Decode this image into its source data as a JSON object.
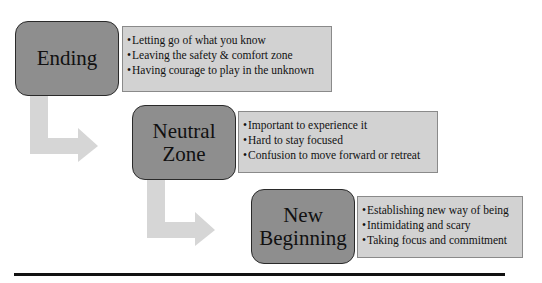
{
  "diagram": {
    "title": "",
    "phases": [
      {
        "label": "Ending",
        "bullets": [
          "Letting go of what you know",
          "Leaving the safety & comfort zone",
          "Having courage to play in the unknown"
        ]
      },
      {
        "label": "Neutral\nZone",
        "bullets": [
          "Important to experience it",
          "Hard to stay focused",
          "Confusion to move forward or retreat"
        ]
      },
      {
        "label": "New\nBeginning",
        "bullets": [
          "Establishing new way of being",
          "Intimidating and scary",
          "Taking focus and commitment"
        ]
      }
    ],
    "colors": {
      "phase_fill": "#8e8e8e",
      "notes_fill": "#d2d2d2",
      "arrow_fill": "#d6d6d6",
      "divider": "#111111"
    }
  }
}
